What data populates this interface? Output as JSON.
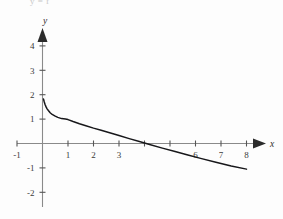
{
  "figure": {
    "background_color": "#fdfdfd",
    "clipped_caption": "y = f",
    "axis_color": "#8a8a8a",
    "curve_color": "#17171a",
    "label_color": "#3a3a3a"
  },
  "chart_data": {
    "type": "line",
    "title": "",
    "subtitle": "",
    "xlabel": "x",
    "ylabel": "y",
    "xlim": [
      -1,
      8
    ],
    "ylim": [
      -2.4,
      4.6
    ],
    "grid": false,
    "legend": null,
    "x_ticks": [
      -1,
      1,
      2,
      3,
      4,
      5,
      6,
      7,
      8
    ],
    "x_tick_labels": [
      "-1",
      "1",
      "2",
      "3",
      "",
      "",
      "6",
      "7",
      "8"
    ],
    "y_ticks": [
      4,
      3,
      2,
      1,
      -1,
      -2
    ],
    "y_tick_labels": [
      "4",
      "3",
      "2",
      "1",
      "-1",
      "-2"
    ],
    "origin_label": "",
    "x_axis_arrow": true,
    "y_axis_arrow": true,
    "x_intercept": 3.4,
    "series": [
      {
        "name": "curve",
        "x": [
          0.04,
          0.07,
          0.1,
          0.14,
          0.18,
          0.23,
          0.3,
          0.38,
          0.48,
          0.6,
          0.75,
          0.9,
          1.0,
          1.2,
          1.45,
          1.7,
          2.0,
          2.3,
          2.6,
          3.0,
          3.4,
          3.8,
          4.2,
          4.7,
          5.2,
          5.7,
          6.2,
          6.8,
          7.4,
          8.0
        ],
        "y": [
          1.82,
          1.7,
          1.6,
          1.5,
          1.42,
          1.35,
          1.26,
          1.19,
          1.13,
          1.07,
          1.02,
          1.0,
          0.98,
          0.9,
          0.81,
          0.73,
          0.63,
          0.54,
          0.45,
          0.33,
          0.2,
          0.08,
          -0.04,
          -0.19,
          -0.33,
          -0.47,
          -0.61,
          -0.77,
          -0.92,
          -1.05
        ]
      }
    ]
  }
}
